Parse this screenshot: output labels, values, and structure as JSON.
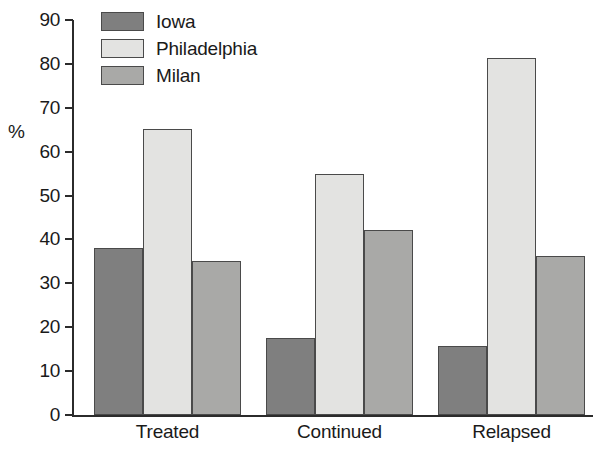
{
  "chart_data": {
    "type": "bar",
    "title": "",
    "subtitle": "",
    "xlabel": "",
    "ylabel": "%",
    "categories": [
      "Treated",
      "Continued",
      "Relapsed"
    ],
    "series": [
      {
        "name": "Iowa",
        "color": "#7f7f7f",
        "values": [
          38.0,
          17.5,
          15.7
        ]
      },
      {
        "name": "Philadelphia",
        "color": "#e3e3e1",
        "values": [
          65.2,
          55.0,
          81.3
        ]
      },
      {
        "name": "Milan",
        "color": "#a9a9a7",
        "values": [
          35.0,
          42.2,
          36.3
        ]
      }
    ],
    "ylim": [
      0,
      90
    ],
    "yticks": [
      0,
      10,
      20,
      30,
      40,
      50,
      60,
      70,
      80,
      90
    ],
    "ytick_labels": [
      "0",
      "10",
      "20",
      "30",
      "40",
      "50",
      "60",
      "70",
      "80",
      "90"
    ],
    "grid": false,
    "legend_position": "top-left",
    "legend_entries": [
      "Iowa",
      "Philadelphia",
      "Milan"
    ],
    "annotations": []
  },
  "axis": {
    "y_title": "%"
  },
  "legend": {
    "items": [
      {
        "label": "Iowa"
      },
      {
        "label": "Philadelphia"
      },
      {
        "label": "Milan"
      }
    ]
  }
}
